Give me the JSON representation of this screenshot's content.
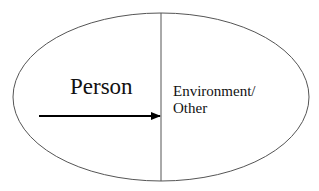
{
  "diagram": {
    "type": "ellipse-split",
    "regions": {
      "left": {
        "label": "Person"
      },
      "right": {
        "label_line1": "Environment/",
        "label_line2": "Other"
      }
    },
    "arrow": {
      "from": "Person",
      "to": "Environment/Other",
      "direction": "right"
    },
    "colors": {
      "outline": "#555555",
      "divider": "#555555",
      "arrow": "#000000",
      "text": "#111111",
      "background": "#ffffff"
    }
  }
}
